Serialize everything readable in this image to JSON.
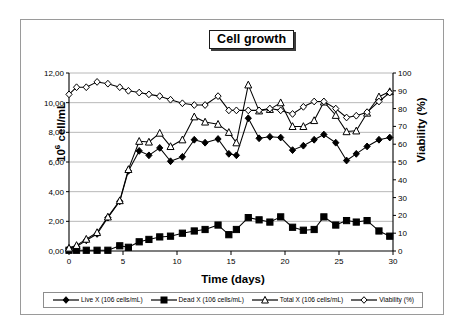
{
  "chart_data": {
    "type": "line",
    "title": "Cell growth",
    "xlabel": "Time (days)",
    "ylabel": "10⁶ cell/mL",
    "y2label": "Viability (%)",
    "xlim": [
      0,
      30
    ],
    "ylim": [
      0,
      12
    ],
    "y2lim": [
      0,
      100
    ],
    "xticks": [
      0,
      5,
      10,
      15,
      20,
      25,
      30
    ],
    "xtick_labels": [
      "0",
      "5",
      "10",
      "15",
      "20",
      "25",
      "30"
    ],
    "yticks": [
      0,
      2,
      4,
      6,
      8,
      10,
      12
    ],
    "ytick_labels": [
      "0,00",
      "2,00",
      "4,00",
      "6,00",
      "8,00",
      "10,00",
      "12,00"
    ],
    "y2ticks": [
      0,
      10,
      20,
      30,
      40,
      50,
      60,
      70,
      80,
      90,
      100
    ],
    "y2tick_labels": [
      "0",
      "10",
      "20",
      "30",
      "40",
      "50",
      "60",
      "70",
      "80",
      "90",
      "100"
    ],
    "grid": "horizontal",
    "legend_position": "bottom",
    "decimal_separator": ",",
    "series": [
      {
        "name": "Live X  (106 cells/mL)",
        "marker": "filled-diamond",
        "axis": "left",
        "color": "#000000",
        "x": [
          0.0,
          0.7,
          1.6,
          2.6,
          3.6,
          4.7,
          5.5,
          6.5,
          7.4,
          8.4,
          9.4,
          10.5,
          11.6,
          12.6,
          13.8,
          14.8,
          15.5,
          16.6,
          17.6,
          18.6,
          19.6,
          20.7,
          21.7,
          22.7,
          23.6,
          24.7,
          25.7,
          26.6,
          27.6,
          28.7,
          29.7
        ],
        "y": [
          0.15,
          0.3,
          0.72,
          1.15,
          2.25,
          3.35,
          5.4,
          6.75,
          6.45,
          6.95,
          6.05,
          6.35,
          7.5,
          7.3,
          7.55,
          6.55,
          6.45,
          8.95,
          7.6,
          7.7,
          7.65,
          6.8,
          7.1,
          7.5,
          7.85,
          7.3,
          6.1,
          6.55,
          7.05,
          7.5,
          7.65
        ]
      },
      {
        "name": "Dead X (106 cells/mL)",
        "marker": "filled-square",
        "axis": "left",
        "color": "#000000",
        "x": [
          0.0,
          0.7,
          1.6,
          2.6,
          3.6,
          4.7,
          5.5,
          6.5,
          7.4,
          8.4,
          9.4,
          10.5,
          11.6,
          12.6,
          13.8,
          14.8,
          15.5,
          16.6,
          17.6,
          18.6,
          19.6,
          20.7,
          21.7,
          22.7,
          23.6,
          24.7,
          25.7,
          26.6,
          27.6,
          28.7,
          29.7
        ],
        "y": [
          0.05,
          0.05,
          0.05,
          0.05,
          0.05,
          0.35,
          0.25,
          0.62,
          0.78,
          0.95,
          1.0,
          1.2,
          1.35,
          1.45,
          1.75,
          1.1,
          1.45,
          2.25,
          2.1,
          1.95,
          2.3,
          1.6,
          1.4,
          1.45,
          2.3,
          1.75,
          2.05,
          1.95,
          2.05,
          1.35,
          1.0
        ]
      },
      {
        "name": "Total X (106 cells/mL)",
        "marker": "open-triangle",
        "axis": "left",
        "color": "#000000",
        "x": [
          0.0,
          0.7,
          1.6,
          2.6,
          3.6,
          4.7,
          5.5,
          6.5,
          7.4,
          8.4,
          9.4,
          10.5,
          11.6,
          12.6,
          13.8,
          14.8,
          15.5,
          16.6,
          17.6,
          18.6,
          19.6,
          20.7,
          21.7,
          22.7,
          23.6,
          24.7,
          25.7,
          26.6,
          27.6,
          28.7,
          29.7
        ],
        "y": [
          0.2,
          0.38,
          0.8,
          1.25,
          2.3,
          3.4,
          5.5,
          7.4,
          7.35,
          7.95,
          7.05,
          7.5,
          9.05,
          8.7,
          8.55,
          8.0,
          7.3,
          11.2,
          9.45,
          9.55,
          10.0,
          8.4,
          8.4,
          8.8,
          10.05,
          9.15,
          8.05,
          8.1,
          9.3,
          10.4,
          10.75
        ]
      },
      {
        "name": "Viability (%)",
        "marker": "open-diamond",
        "axis": "right",
        "color": "#000000",
        "x": [
          0.0,
          0.7,
          1.6,
          2.6,
          3.6,
          4.7,
          5.5,
          6.5,
          7.4,
          8.4,
          9.4,
          10.5,
          11.6,
          12.6,
          13.8,
          14.8,
          15.5,
          16.6,
          17.6,
          18.6,
          19.6,
          20.7,
          21.7,
          22.7,
          23.6,
          24.7,
          25.7,
          26.6,
          27.6,
          28.7,
          29.7
        ],
        "y": [
          88,
          92,
          92,
          95,
          94,
          92,
          90,
          89,
          88,
          87,
          85,
          83,
          82,
          82,
          87,
          79,
          79,
          79,
          79,
          80,
          79,
          77,
          81,
          84,
          84,
          80,
          75,
          76,
          78,
          84,
          89
        ]
      }
    ]
  },
  "legend": {
    "entries": [
      {
        "label": "Live X  (106 cells/mL)",
        "marker": "filled-diamond"
      },
      {
        "label": "Dead X (106 cells/mL)",
        "marker": "filled-square"
      },
      {
        "label": "Total X (106 cells/mL)",
        "marker": "open-triangle"
      },
      {
        "label": "Viability (%)",
        "marker": "open-diamond"
      }
    ]
  },
  "axes": {
    "x_title": "Time (days)",
    "y_left_prefix": "10",
    "y_left_sup": "6",
    "y_left_suffix": " cell/mL",
    "y_right_title": "Viability (%)"
  },
  "title": {
    "text": "Cell growth"
  }
}
